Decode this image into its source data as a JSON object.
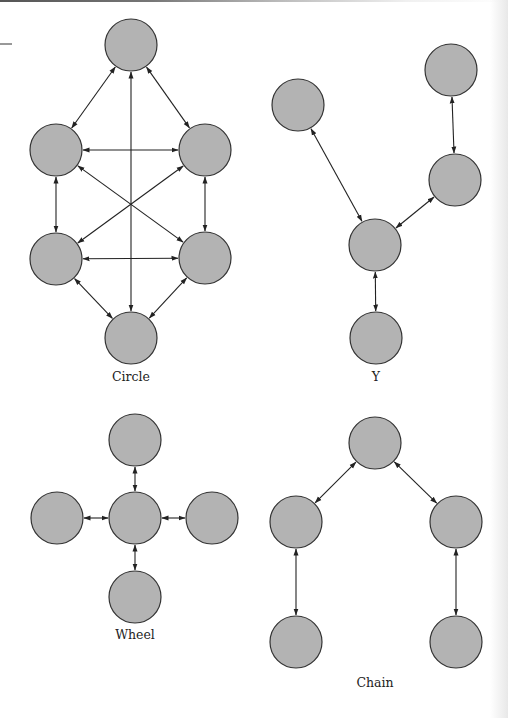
{
  "style": {
    "node_fill": "#b3b3b3",
    "node_stroke": "#333333",
    "edge_color": "#222222",
    "node_radius": 26
  },
  "diagrams": [
    {
      "id": "circle",
      "label": "Circle",
      "label_pos": [
        131,
        381
      ],
      "nodes": [
        [
          131,
          45
        ],
        [
          56,
          150
        ],
        [
          205,
          150
        ],
        [
          56,
          259
        ],
        [
          205,
          258
        ],
        [
          131,
          338
        ]
      ],
      "edges": [
        [
          0,
          1
        ],
        [
          0,
          2
        ],
        [
          1,
          2
        ],
        [
          1,
          3
        ],
        [
          2,
          4
        ],
        [
          3,
          4
        ],
        [
          3,
          5
        ],
        [
          4,
          5
        ],
        [
          0,
          5
        ],
        [
          1,
          4
        ],
        [
          2,
          3
        ]
      ]
    },
    {
      "id": "y",
      "label": "Y",
      "label_pos": [
        376,
        381
      ],
      "nodes": [
        [
          298,
          105
        ],
        [
          451,
          70
        ],
        [
          455,
          180
        ],
        [
          375,
          245
        ],
        [
          376,
          338
        ]
      ],
      "edges": [
        [
          0,
          3
        ],
        [
          1,
          2
        ],
        [
          2,
          3
        ],
        [
          3,
          4
        ]
      ]
    },
    {
      "id": "wheel",
      "label": "Wheel",
      "label_pos": [
        135,
        639
      ],
      "nodes": [
        [
          135,
          440
        ],
        [
          57,
          518
        ],
        [
          135,
          518
        ],
        [
          212,
          518
        ],
        [
          135,
          597
        ]
      ],
      "edges": [
        [
          0,
          2
        ],
        [
          1,
          2
        ],
        [
          2,
          3
        ],
        [
          2,
          4
        ]
      ]
    },
    {
      "id": "chain",
      "label": "Chain",
      "label_pos": [
        375,
        687
      ],
      "nodes": [
        [
          375,
          443
        ],
        [
          296,
          522
        ],
        [
          456,
          522
        ],
        [
          296,
          642
        ],
        [
          456,
          642
        ]
      ],
      "edges": [
        [
          0,
          1
        ],
        [
          0,
          2
        ],
        [
          1,
          3
        ],
        [
          2,
          4
        ]
      ]
    }
  ],
  "decor": {
    "margin_rule": [
      0,
      44,
      12,
      44
    ]
  }
}
